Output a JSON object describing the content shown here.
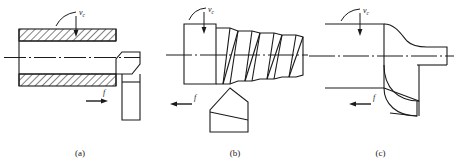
{
  "figure": {
    "stroke_color": "#1a1a1a",
    "background_color": "#ffffff"
  },
  "panels": [
    {
      "id": "a",
      "caption": "(a)",
      "operation": "cylindrical-turning",
      "speed_label": "v",
      "speed_subscript": "c",
      "feed_label": "f",
      "feed_direction": "right",
      "workpiece": "hatched-sectioned-cylinder",
      "tool": "straight-turning-tool"
    },
    {
      "id": "b",
      "caption": "(b)",
      "operation": "thread-cutting",
      "speed_label": "v",
      "speed_subscript": "c",
      "feed_label": "f",
      "feed_direction": "left",
      "workpiece": "threaded-shaft",
      "tool": "v-threading-tool"
    },
    {
      "id": "c",
      "caption": "(c)",
      "operation": "form-turning",
      "speed_label": "v",
      "speed_subscript": "c",
      "feed_label": "f",
      "feed_direction": "left",
      "workpiece": "stepped-shaft-with-fillet",
      "tool": "form-tool-concave"
    }
  ]
}
